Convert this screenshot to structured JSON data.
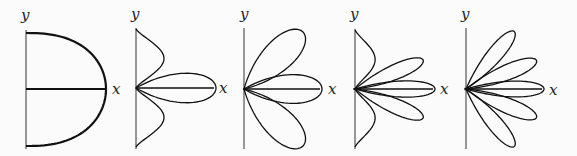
{
  "figure": {
    "panels": [
      {
        "id": "panel-1",
        "x_label": "x",
        "y_label": "y"
      },
      {
        "id": "panel-2",
        "x_label": "x",
        "y_label": "y"
      },
      {
        "id": "panel-3",
        "x_label": "x",
        "y_label": "y"
      },
      {
        "id": "panel-4",
        "x_label": "x",
        "y_label": "y"
      },
      {
        "id": "panel-5",
        "x_label": "x",
        "y_label": "y"
      }
    ]
  },
  "chart_data": [
    {
      "type": "polar-curve",
      "description": "single oval lobe in right half-plane, bisected by x-axis",
      "origin": [
        26,
        89
      ],
      "y_axis": [
        30,
        149
      ],
      "x_axis_end": 106,
      "oval": {
        "width": 80,
        "top": 33,
        "bottom": 146
      },
      "bold": true
    },
    {
      "type": "polar-rose",
      "description": "horizontal petal plus half-lobes at top and bottom",
      "origin": [
        136,
        88
      ],
      "y_axis": [
        28,
        149
      ],
      "petals_deg": [
        0
      ],
      "petal_len": 80,
      "petal_w": 3,
      "half_lobes": {
        "top": 29,
        "bottom": 147,
        "bulge": 32
      }
    },
    {
      "type": "polar-rose",
      "description": "three full petals",
      "origin": [
        244,
        89
      ],
      "y_axis": [
        28,
        149
      ],
      "petals_deg": [
        0,
        44,
        -44
      ],
      "petal_len": [
        78,
        82,
        82
      ],
      "petal_w": 3
    },
    {
      "type": "polar-rose",
      "description": "three full petals plus half-lobes at top and bottom",
      "origin": [
        355,
        89
      ],
      "y_axis": [
        29,
        149
      ],
      "petals_deg": [
        0,
        23,
        -23
      ],
      "petal_len": [
        80,
        74,
        74
      ],
      "petal_w": 5.5,
      "half_lobes": {
        "top": 30,
        "bottom": 147,
        "bulge": 23
      }
    },
    {
      "type": "polar-rose",
      "description": "five full petals",
      "origin": [
        466,
        89
      ],
      "y_axis": [
        28,
        149
      ],
      "petals_deg": [
        0,
        22,
        -22,
        50,
        -50
      ],
      "petal_len": [
        78,
        76,
        76,
        75,
        75
      ],
      "petal_w": 5.5
    }
  ]
}
